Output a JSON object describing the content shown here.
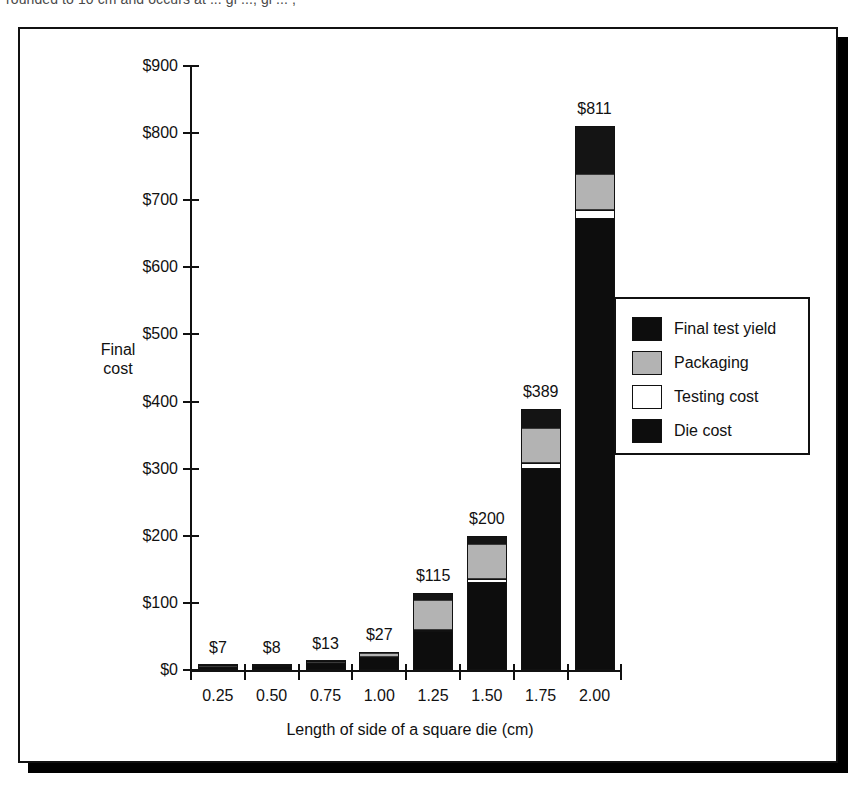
{
  "caption": {
    "text": "rounded to 10 cm and occurs at ... gi ..., gi ... ,"
  },
  "chart_data": {
    "type": "bar",
    "stacked": true,
    "title": "",
    "xlabel": "Length of side of a square die (cm)",
    "ylabel_line1": "Final",
    "ylabel_line2": "cost",
    "grid": false,
    "legend_position": "right-inside",
    "categories": [
      "0.25",
      "0.50",
      "0.75",
      "1.00",
      "1.25",
      "1.50",
      "1.75",
      "2.00"
    ],
    "ylim": [
      0,
      900
    ],
    "yticks": [
      "$0",
      "$100",
      "$200",
      "$300",
      "$400",
      "$500",
      "$600",
      "$700",
      "$800",
      "$900"
    ],
    "ytick_values": [
      0,
      100,
      200,
      300,
      400,
      500,
      600,
      700,
      800,
      900
    ],
    "totals": [
      "$7",
      "$8",
      "$13",
      "$27",
      "$115",
      "$200",
      "$389",
      "$811"
    ],
    "total_values": [
      7,
      8,
      13,
      27,
      115,
      200,
      389,
      811
    ],
    "series": [
      {
        "name": "Die cost",
        "color": "#0d0d0d",
        "values": [
          3,
          5,
          9,
          18,
          57,
          130,
          299,
          672
        ]
      },
      {
        "name": "Testing cost",
        "color": "#ffffff",
        "values": [
          1,
          1,
          1,
          2,
          3,
          5,
          10,
          14
        ]
      },
      {
        "name": "Packaging",
        "color": "#b3b3b3",
        "values": [
          2,
          1,
          2,
          5,
          45,
          53,
          52,
          53
        ]
      },
      {
        "name": "Final test yield",
        "color": "#141414",
        "values": [
          1,
          1,
          1,
          2,
          10,
          12,
          28,
          72
        ]
      }
    ],
    "legend": [
      {
        "label": "Final test yield",
        "swatch": "black"
      },
      {
        "label": "Packaging",
        "swatch": "gray"
      },
      {
        "label": "Testing cost",
        "swatch": "white"
      },
      {
        "label": "Die cost",
        "swatch": "black"
      }
    ]
  }
}
